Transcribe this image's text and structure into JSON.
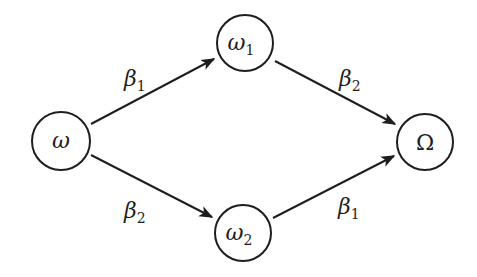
{
  "diagram": {
    "type": "directed-graph",
    "stroke_color": "#1e1e1e",
    "background": "#ffffff",
    "nodes": [
      {
        "id": "w",
        "symbol": "ω",
        "subscript": "",
        "cx": 61,
        "cy": 141,
        "r": 29
      },
      {
        "id": "w1",
        "symbol": "ω",
        "subscript": "1",
        "cx": 245,
        "cy": 43,
        "r": 28
      },
      {
        "id": "w2",
        "symbol": "ω",
        "subscript": "2",
        "cx": 243,
        "cy": 233,
        "r": 28
      },
      {
        "id": "W",
        "symbol": "Ω",
        "subscript": "",
        "cx": 425,
        "cy": 142,
        "r": 28
      }
    ],
    "edges": [
      {
        "from": "w",
        "to": "w1",
        "label": "β",
        "subscript": "1"
      },
      {
        "from": "w1",
        "to": "W",
        "label": "β",
        "subscript": "2"
      },
      {
        "from": "w",
        "to": "w2",
        "label": "β",
        "subscript": "2"
      },
      {
        "from": "w2",
        "to": "W",
        "label": "β",
        "subscript": "1"
      }
    ]
  }
}
